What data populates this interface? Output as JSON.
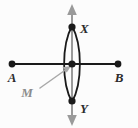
{
  "figure": {
    "background_color": "#fcfcfc",
    "width": 138,
    "height": 128,
    "colors": {
      "line_black": "#1a1a1a",
      "arc_black": "#1a1a1a",
      "bisector_gray": "#9a9a9a",
      "leader_gray": "#a8a8a8",
      "label_black": "#2b2b2b",
      "label_gray": "#8c8c8c"
    },
    "labels": {
      "a": "A",
      "b": "B",
      "x": "X",
      "y": "Y",
      "m": "M"
    },
    "points": [
      {
        "name": "A",
        "label": "A",
        "x": 12,
        "y": 64,
        "dot": true,
        "dot_color": "#1a1a1a",
        "label_x": 12,
        "label_y": 80
      },
      {
        "name": "B",
        "label": "B",
        "x": 118,
        "y": 64,
        "dot": true,
        "dot_color": "#1a1a1a",
        "label_x": 119,
        "label_y": 80
      },
      {
        "name": "X",
        "label": "X",
        "x": 72,
        "y": 27,
        "dot": true,
        "dot_color": "#1a1a1a",
        "label_x": 80,
        "label_y": 31
      },
      {
        "name": "Y",
        "label": "Y",
        "x": 72,
        "y": 101,
        "dot": true,
        "dot_color": "#1a1a1a",
        "label_x": 80,
        "label_y": 112
      },
      {
        "name": "M",
        "label": "M",
        "x": 72,
        "y": 64,
        "dot": true,
        "dot_color": "#1a1a1a",
        "label_x": 27,
        "label_y": 95
      }
    ],
    "segment_ab": {
      "x1": 12,
      "y1": 64,
      "x2": 118,
      "y2": 64,
      "stroke": "#1a1a1a",
      "stroke_width": 2
    },
    "bisector_line": {
      "x1": 72,
      "y1": 8,
      "x2": 72,
      "y2": 122,
      "stroke": "#9a9a9a",
      "stroke_width": 2,
      "arrows": "both"
    },
    "arcs": [
      {
        "name": "arc-left-center",
        "d": "M 72 25 C 62 45, 62 83, 72 103",
        "stroke": "#1a1a1a",
        "stroke_width": 1.7
      },
      {
        "name": "arc-right-center",
        "d": "M 72 25 C 82 45, 82 83, 72 103",
        "stroke": "#1a1a1a",
        "stroke_width": 1.7
      }
    ],
    "leader": {
      "x1": 40,
      "y1": 88,
      "x2": 69,
      "y2": 67,
      "stroke": "#a8a8a8",
      "stroke_width": 1.4,
      "arrow_at": "end"
    }
  }
}
